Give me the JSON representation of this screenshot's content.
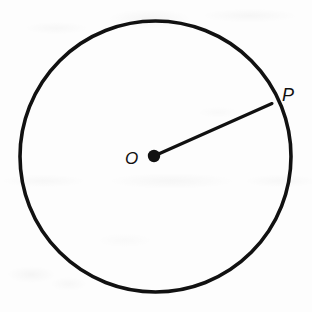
{
  "figure": {
    "kind": "circle-with-radius-diagram",
    "canvas": {
      "width": 312,
      "height": 312
    },
    "background_color": "#fdfdfd",
    "stroke_color": "#111111",
    "circle": {
      "name": "circle-outline",
      "center_x": 155.5,
      "center_y": 156.5,
      "radius": 135.5,
      "stroke_width": 3.6,
      "fill": "none"
    },
    "center_point": {
      "name": "center-point-O",
      "x": 154,
      "y": 156,
      "radius": 6.2,
      "fill": "#111111"
    },
    "radius_segment": {
      "name": "radius-segment-OP",
      "x1": 154,
      "y1": 156,
      "x2": 272,
      "y2": 103.5,
      "stroke_width": 3.1
    },
    "labels": [
      {
        "name": "center-label",
        "text": "O",
        "x": 125,
        "y": 150
      },
      {
        "name": "point-label",
        "text": "P",
        "x": 282,
        "y": 86
      }
    ]
  }
}
